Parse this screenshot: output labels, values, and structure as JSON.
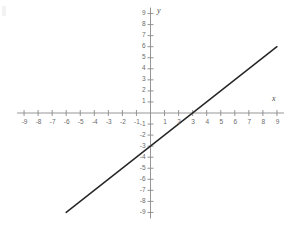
{
  "figure": {
    "background_color": "#ffffff",
    "axis_color": "#8a8a8a",
    "line_color": "#262626",
    "label_color": "#6b6b6b",
    "x_axis_name": "x",
    "y_axis_name": "y"
  },
  "chart_data": {
    "type": "line",
    "title": "",
    "subtitle": "",
    "xlabel": "x",
    "ylabel": "y",
    "xlim": [
      -9,
      9
    ],
    "ylim": [
      -9,
      9
    ],
    "grid": false,
    "legend": "none",
    "x_ticks": [
      -9,
      -8,
      -7,
      -6,
      -5,
      -4,
      -3,
      -2,
      -1,
      1,
      2,
      3,
      4,
      5,
      6,
      7,
      8,
      9
    ],
    "y_ticks": [
      -9,
      -8,
      -7,
      -6,
      -5,
      -4,
      -3,
      -2,
      -1,
      1,
      2,
      3,
      4,
      5,
      6,
      7,
      8,
      9
    ],
    "x_tick_labels": [
      "-9",
      "-8",
      "-7",
      "-6",
      "-5",
      "-4",
      "-3",
      "-2",
      "-1",
      "1",
      "2",
      "3",
      "4",
      "5",
      "6",
      "7",
      "8",
      "9"
    ],
    "y_tick_labels": [
      "-9",
      "-8",
      "-7",
      "-6",
      "-5",
      "-4",
      "-3",
      "-2",
      "-1",
      "1",
      "2",
      "3",
      "4",
      "5",
      "6",
      "7",
      "8",
      "9"
    ],
    "series": [
      {
        "name": "y = x - 3",
        "slope": 1,
        "intercept": -3,
        "x_intercept": 3,
        "y_intercept": -3,
        "x": [
          -6,
          9
        ],
        "values": [
          -9,
          6
        ],
        "endpoints": [
          [
            -6,
            -9
          ],
          [
            9,
            6
          ]
        ]
      }
    ],
    "annotations": []
  }
}
